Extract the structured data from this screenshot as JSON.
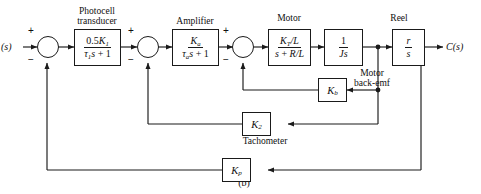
{
  "figure": {
    "label": "(b)",
    "type": "control-system-block-diagram"
  },
  "io": {
    "input_label": "(s)",
    "output_label": "C(s)"
  },
  "captions": {
    "photocell": "Photocell\ntransducer",
    "photocell_line1": "Photocell",
    "photocell_line2": "transducer",
    "amplifier": "Amplifier",
    "motor": "Motor",
    "reel": "Reel",
    "back_emf_line1": "Motor",
    "back_emf_line2": "back-emf",
    "tachometer": "Tachometer"
  },
  "blocks": [
    {
      "id": "photocell",
      "name": "photocell-transducer-block",
      "caption": "Photocell transducer",
      "numerator": "0.5K1",
      "denominator": "τ1s + 1",
      "transfer_function": "0.5K1/(τ1s + 1)"
    },
    {
      "id": "amplifier",
      "name": "amplifier-block",
      "caption": "Amplifier",
      "numerator": "Ka",
      "denominator": "τas + 1",
      "transfer_function": "Ka/(τas + 1)"
    },
    {
      "id": "motor",
      "name": "motor-block",
      "caption": "Motor",
      "numerator": "KT/L",
      "denominator": "s + R/L",
      "transfer_function": "(KT/L)/(s + R/L)"
    },
    {
      "id": "inertia",
      "name": "inertia-block",
      "caption": "",
      "numerator": "1",
      "denominator": "Js",
      "transfer_function": "1/(Js)"
    },
    {
      "id": "reel",
      "name": "reel-block",
      "caption": "Reel",
      "numerator": "r",
      "denominator": "s",
      "transfer_function": "r/s"
    },
    {
      "id": "back_emf",
      "name": "back-emf-gain-block",
      "caption": "Motor back-emf",
      "gain": "Kb"
    },
    {
      "id": "tachometer",
      "name": "tachometer-gain-block",
      "caption": "Tachometer",
      "gain": "K2"
    },
    {
      "id": "position_feedback",
      "name": "position-feedback-gain-block",
      "caption": "",
      "gain": "Kp"
    }
  ],
  "summing_junctions": [
    {
      "id": "sum1",
      "name": "summing-junction-1",
      "plus": "+",
      "minus": "−"
    },
    {
      "id": "sum2",
      "name": "summing-junction-2",
      "plus": "+",
      "minus": "−"
    },
    {
      "id": "sum3",
      "name": "summing-junction-3",
      "plus": "+",
      "minus": "−"
    }
  ],
  "colors": {
    "line": "#1a1a1a",
    "text": "#101010",
    "background": "#ffffff"
  }
}
